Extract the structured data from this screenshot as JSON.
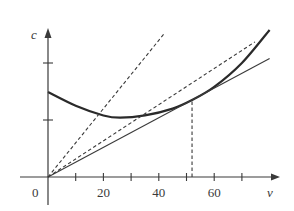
{
  "chart_data": {
    "type": "line",
    "title": "",
    "xlabel": "v",
    "ylabel": "c",
    "origin_label": "0",
    "xlim": [
      0,
      84
    ],
    "ylim": [
      0,
      2.8
    ],
    "x_ticks": [
      10,
      20,
      30,
      40,
      50,
      60,
      70
    ],
    "x_tick_labels": [
      {
        "v": 20,
        "label": "20"
      },
      {
        "v": 40,
        "label": "40"
      },
      {
        "v": 60,
        "label": "60"
      }
    ],
    "y_ticks": [
      1,
      2
    ],
    "grid": false,
    "legend": null,
    "series": [
      {
        "name": "cost curve c(v)",
        "style": "solid-thick",
        "x": [
          0,
          10,
          20,
          26,
          35,
          45,
          52,
          60,
          70,
          80
        ],
        "y": [
          1.49,
          1.25,
          1.08,
          1.04,
          1.08,
          1.2,
          1.35,
          1.58,
          2.0,
          2.58
        ]
      },
      {
        "name": "tangent line through origin",
        "style": "solid-thin",
        "x": [
          0,
          80
        ],
        "y": [
          0,
          2.08
        ]
      },
      {
        "name": "dashed line (shallow)",
        "style": "dashed",
        "x": [
          0,
          74.7
        ],
        "y": [
          0,
          2.37
        ]
      },
      {
        "name": "dashed line (steep)",
        "style": "dashed",
        "x": [
          0,
          42.2
        ],
        "y": [
          0,
          2.53
        ]
      }
    ],
    "annotations": [
      {
        "type": "vertical-dashed",
        "x": 52,
        "y_from": 0,
        "y_to": 1.35,
        "note": "tangency point"
      }
    ]
  }
}
